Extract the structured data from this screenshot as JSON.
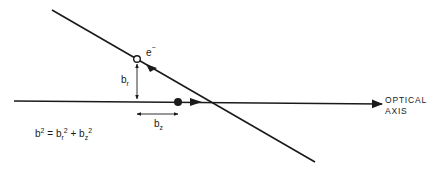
{
  "diagram": {
    "labels": {
      "electron": "e",
      "electron_charge": "−",
      "b_r_base": "b",
      "b_r_sub": "r",
      "b_z_base": "b",
      "b_z_sub": "z",
      "optical_axis_line1": "OPTICAL",
      "optical_axis_line2": "AXIS"
    },
    "formula": {
      "b": "b",
      "b_exp": "2",
      "eq": " = ",
      "br": "b",
      "br_sub": "r",
      "br_exp": "2",
      "plus": " + ",
      "bz": "b",
      "bz_sub": "z",
      "bz_exp": "2"
    },
    "colors": {
      "line": "#1a1a1a",
      "background": "#ffffff"
    }
  }
}
